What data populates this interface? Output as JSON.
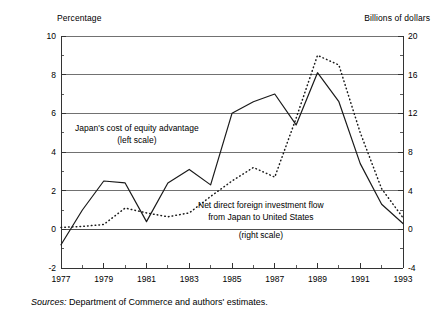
{
  "figure": {
    "left_axis_title": "Percentage",
    "right_axis_title": "Billions of dollars",
    "source_prefix": "Sources:",
    "source_text": " Department of Commerce and authors' estimates."
  },
  "annotations": {
    "series1_line1": "Japan's cost of equity advantage",
    "series1_line2": "(left scale)",
    "series2_line1": "Net direct foreign investment flow",
    "series2_line2": "from Japan to United States",
    "series2_line3": "(right scale)"
  },
  "chart_data": {
    "type": "line",
    "title": "",
    "xlabel": "",
    "ylabel": "Percentage",
    "y2label": "Billions of dollars",
    "grid": true,
    "legend": "inline-annotations",
    "x": [
      1977,
      1978,
      1979,
      1980,
      1981,
      1982,
      1983,
      1984,
      1985,
      1986,
      1987,
      1988,
      1989,
      1990,
      1991,
      1992,
      1993
    ],
    "xlim": [
      1977,
      1993
    ],
    "xticks": [
      1977,
      1979,
      1981,
      1983,
      1985,
      1987,
      1989,
      1991,
      1993
    ],
    "xticklabels": [
      "1977",
      "1979",
      "1981",
      "1983",
      "1985",
      "1987",
      "1989",
      "1991",
      "1993"
    ],
    "xticks_minor": [
      1978,
      1980,
      1982,
      1984,
      1986,
      1988,
      1990,
      1992
    ],
    "ylim": [
      -2,
      10
    ],
    "yticks": [
      -2,
      0,
      2,
      4,
      6,
      8,
      10
    ],
    "yticklabels": [
      "-2",
      "0",
      "2",
      "4",
      "6",
      "8",
      "10"
    ],
    "y2lim": [
      -4,
      20
    ],
    "y2ticks": [
      -4,
      0,
      4,
      8,
      12,
      16,
      20
    ],
    "y2ticklabels": [
      "-4",
      "0",
      "4",
      "8",
      "12",
      "16",
      "20"
    ],
    "series": [
      {
        "name": "Japan's cost of equity advantage (left scale)",
        "axis": "left",
        "style": "solid",
        "color": "#1a1a1a",
        "values": [
          -0.8,
          1.0,
          2.5,
          2.4,
          0.4,
          2.4,
          3.1,
          2.3,
          6.0,
          6.6,
          7.0,
          5.4,
          8.1,
          6.6,
          3.4,
          1.3,
          0.3
        ]
      },
      {
        "name": "Net direct foreign investment flow from Japan to United States (right scale)",
        "axis": "right",
        "style": "dotted",
        "color": "#1a1a1a",
        "values": [
          0.2,
          0.3,
          0.5,
          2.2,
          1.7,
          1.3,
          1.7,
          3.4,
          5.0,
          6.4,
          5.4,
          11.5,
          18.0,
          17.0,
          10.0,
          4.2,
          1.2
        ]
      }
    ]
  }
}
